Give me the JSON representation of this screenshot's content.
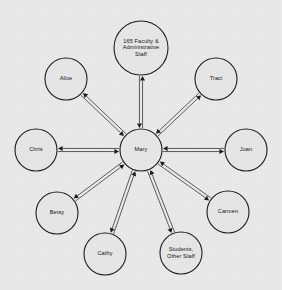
{
  "diagram": {
    "type": "node-link-hub-and-spoke",
    "background_color": "#e9e9e9",
    "node_fill_color": "#e6e6e6",
    "node_stroke_color": "#1a1a1a",
    "edge_color": "#2a2a2a",
    "label_color": "#111111"
  },
  "center": {
    "id": "mary",
    "label": "Mary",
    "lines": [
      "Mary"
    ],
    "cx": 141,
    "cy": 150,
    "r": 21
  },
  "nodes": [
    {
      "id": "faculty",
      "label": "165 Faculty & Administrative Staff",
      "lines": [
        "165 Faculty &",
        "Administrative",
        "Staff"
      ],
      "cx": 141,
      "cy": 48,
      "r": 27
    },
    {
      "id": "alice",
      "label": "Alice",
      "lines": [
        "Alice"
      ],
      "cx": 66,
      "cy": 79,
      "r": 21
    },
    {
      "id": "traci",
      "label": "Traci",
      "lines": [
        "Traci"
      ],
      "cx": 216,
      "cy": 79,
      "r": 21
    },
    {
      "id": "chris",
      "label": "Chris",
      "lines": [
        "Chris"
      ],
      "cx": 36,
      "cy": 150,
      "r": 21
    },
    {
      "id": "joan",
      "label": "Joan",
      "lines": [
        "Joan"
      ],
      "cx": 246,
      "cy": 150,
      "r": 21
    },
    {
      "id": "betsy",
      "label": "Betsy",
      "lines": [
        "Betsy"
      ],
      "cx": 57,
      "cy": 213,
      "r": 21
    },
    {
      "id": "carmen",
      "label": "Carmen",
      "lines": [
        "Carmen"
      ],
      "cx": 228,
      "cy": 212,
      "r": 21
    },
    {
      "id": "cathy",
      "label": "Cathy",
      "lines": [
        "Cathy"
      ],
      "cx": 105,
      "cy": 254,
      "r": 21
    },
    {
      "id": "students",
      "label": "Students, Other Staff",
      "lines": [
        "Students,",
        "Other Staff"
      ],
      "cx": 181,
      "cy": 253,
      "r": 21
    }
  ],
  "edges": [
    {
      "from": "mary",
      "to": "faculty",
      "bidirectional": true
    },
    {
      "from": "mary",
      "to": "alice",
      "bidirectional": true
    },
    {
      "from": "mary",
      "to": "traci",
      "bidirectional": true
    },
    {
      "from": "mary",
      "to": "chris",
      "bidirectional": true
    },
    {
      "from": "mary",
      "to": "joan",
      "bidirectional": true
    },
    {
      "from": "mary",
      "to": "betsy",
      "bidirectional": true
    },
    {
      "from": "mary",
      "to": "carmen",
      "bidirectional": true
    },
    {
      "from": "mary",
      "to": "cathy",
      "bidirectional": true
    },
    {
      "from": "mary",
      "to": "students",
      "bidirectional": true
    }
  ]
}
